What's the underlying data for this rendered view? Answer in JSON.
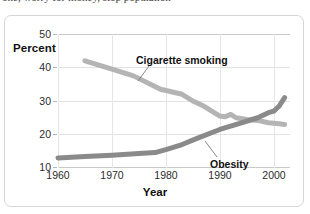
{
  "page": {
    "top_cut_text": "one, worry for money, stop population"
  },
  "figure": {
    "y_axis_title": "Percent",
    "x_axis_title": "Year",
    "y_ticks": [
      "10",
      "20",
      "30",
      "40",
      "50"
    ],
    "x_ticks": [
      "1960",
      "1970",
      "1980",
      "1990",
      "2000"
    ],
    "annotations": {
      "smoking": "Cigarette smoking",
      "obesity": "Obesity"
    },
    "colors": {
      "smoking_line": "#b4b4b4",
      "obesity_line": "#8a8a8a",
      "grid": "#e2e2e2",
      "axis": "#c9c9c9",
      "card_border": "#d6d6d6",
      "text": "#111111"
    }
  },
  "chart_data": {
    "type": "line",
    "title": "",
    "xlabel": "Year",
    "ylabel": "Percent",
    "xlim": [
      1960,
      2003
    ],
    "ylim": [
      10,
      50
    ],
    "xticks": [
      1960,
      1970,
      1980,
      1990,
      2000
    ],
    "yticks": [
      10,
      20,
      30,
      40,
      50
    ],
    "grid": true,
    "legend": "inline-annotations",
    "series": [
      {
        "name": "Cigarette smoking",
        "color": "#b4b4b4",
        "x": [
          1965,
          1970,
          1974,
          1979,
          1983,
          1985,
          1987,
          1990,
          1991,
          1992,
          1993,
          1995,
          1997,
          1999,
          2001,
          2002
        ],
        "values": [
          42.0,
          39.5,
          37.5,
          33.5,
          32.0,
          30.0,
          28.5,
          25.5,
          25.3,
          26.0,
          25.0,
          24.5,
          24.2,
          23.5,
          23.2,
          23.0
        ]
      },
      {
        "name": "Obesity",
        "color": "#8a8a8a",
        "x": [
          1960,
          1965,
          1970,
          1975,
          1978,
          1980,
          1983,
          1986,
          1990,
          1994,
          1997,
          1999,
          2000,
          2001,
          2002
        ],
        "values": [
          13.0,
          13.4,
          13.8,
          14.3,
          14.6,
          15.5,
          17.0,
          19.0,
          21.5,
          23.5,
          25.0,
          26.5,
          27.0,
          28.5,
          31.0
        ]
      }
    ]
  }
}
